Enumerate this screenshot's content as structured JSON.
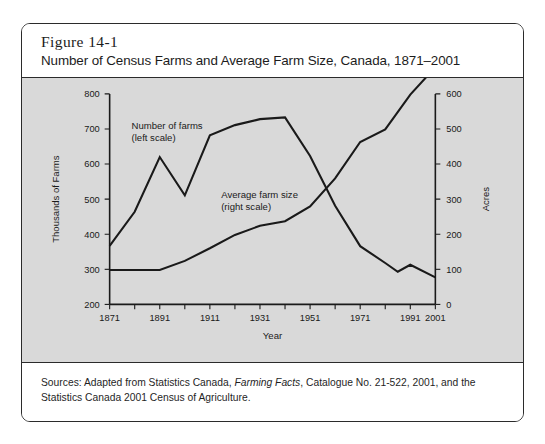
{
  "figure": {
    "number": "Figure 14-1",
    "title": "Number of Census Farms and Average Farm Size, Canada, 1871–2001",
    "source_prefix": "Sources: Adapted from Statistics Canada, ",
    "source_italic": "Farming Facts",
    "source_suffix": ", Catalogue No. 21-522, 2001, and the Statistics Canada 2001 Census of Agriculture."
  },
  "chart_data": {
    "type": "line",
    "title": "Number of Census Farms and Average Farm Size, Canada, 1871–2001",
    "xlabel": "Year",
    "ylabel": "Thousands of Farms",
    "y2label": "Acres",
    "xlim": [
      1871,
      2001
    ],
    "ylim": [
      200,
      800
    ],
    "y2lim": [
      0,
      600
    ],
    "yticks": [
      200,
      300,
      400,
      500,
      600,
      700,
      800
    ],
    "y2ticks": [
      0,
      100,
      200,
      300,
      400,
      500,
      600
    ],
    "xticks": [
      1871,
      1881,
      1891,
      1901,
      1911,
      1921,
      1931,
      1941,
      1951,
      1961,
      1971,
      1981,
      1991,
      2001
    ],
    "xticklabels": [
      "1871",
      "",
      "1891",
      "",
      "1911",
      "",
      "1931",
      "",
      "1951",
      "",
      "1971",
      "",
      "1991",
      "2001"
    ],
    "grid": false,
    "legend": "inline-annotations",
    "series": [
      {
        "name": "Number of farms (left scale)",
        "axis": "left",
        "units": "thousands of farms",
        "annotation_line1": "Number of farms",
        "annotation_line2": "(left scale)",
        "x": [
          1871,
          1881,
          1891,
          1901,
          1911,
          1921,
          1931,
          1941,
          1951,
          1961,
          1971,
          1981,
          1986,
          1991,
          2001
        ],
        "values": [
          367,
          464,
          620,
          511,
          682,
          711,
          728,
          733,
          623,
          481,
          366,
          318,
          293,
          313,
          277
        ]
      },
      {
        "name": "Average farm size (right scale)",
        "axis": "right",
        "units": "acres",
        "annotation_line1": "Average farm size",
        "annotation_line2": "(right scale)",
        "x": [
          1871,
          1881,
          1891,
          1901,
          1911,
          1921,
          1931,
          1941,
          1951,
          1961,
          1971,
          1981,
          1991,
          2001
        ],
        "values": [
          98,
          98,
          98,
          124,
          160,
          198,
          224,
          237,
          279,
          359,
          463,
          499,
          598,
          676
        ]
      }
    ]
  }
}
